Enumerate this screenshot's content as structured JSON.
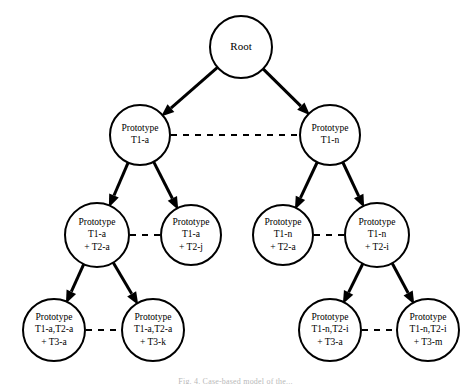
{
  "figure": {
    "caption": "Fig. 4. Case-based model of the...",
    "background_color": "#ffffff",
    "line_color": "#000000"
  },
  "nodes": [
    {
      "id": "root",
      "level": 0,
      "cx": 241,
      "cy": 47,
      "r": 31,
      "lines": [
        "Root"
      ]
    },
    {
      "id": "p-t1a",
      "level": 1,
      "cx": 140,
      "cy": 135,
      "r": 30,
      "lines": [
        "Prototype",
        "T1-a"
      ]
    },
    {
      "id": "p-t1n",
      "level": 1,
      "cx": 330,
      "cy": 135,
      "r": 30,
      "lines": [
        "Prototype",
        "T1-n"
      ]
    },
    {
      "id": "p-t1a-t2a",
      "level": 2,
      "cx": 97,
      "cy": 235,
      "r": 32,
      "lines": [
        "Prototype",
        "T1-a",
        "+ T2-a"
      ]
    },
    {
      "id": "p-t1a-t2j",
      "level": 2,
      "cx": 191,
      "cy": 235,
      "r": 30,
      "lines": [
        "Prototype",
        "T1-a",
        "+ T2-j"
      ]
    },
    {
      "id": "p-t1n-t2a",
      "level": 2,
      "cx": 283,
      "cy": 235,
      "r": 30,
      "lines": [
        "Prototype",
        "T1-n",
        "+ T2-a"
      ]
    },
    {
      "id": "p-t1n-t2i",
      "level": 2,
      "cx": 377,
      "cy": 235,
      "r": 32,
      "lines": [
        "Prototype",
        "T1-n",
        "+ T2-i"
      ]
    },
    {
      "id": "p-t1a-t2a-t3a",
      "level": 3,
      "cx": 54,
      "cy": 330,
      "r": 31,
      "lines": [
        "Prototype",
        "T1-a,T2-a",
        "+ T3-a"
      ]
    },
    {
      "id": "p-t1a-t2a-t3k",
      "level": 3,
      "cx": 153,
      "cy": 330,
      "r": 31,
      "lines": [
        "Prototype",
        "T1-a,T2-a",
        "+ T3-k"
      ]
    },
    {
      "id": "p-t1n-t2i-t3a",
      "level": 3,
      "cx": 330,
      "cy": 330,
      "r": 31,
      "lines": [
        "Prototype",
        "T1-n,T2-i",
        "+ T3-a"
      ]
    },
    {
      "id": "p-t1n-t2i-t3m",
      "level": 3,
      "cx": 428,
      "cy": 330,
      "r": 31,
      "lines": [
        "Prototype",
        "T1-n,T2-i",
        "+ T3-m"
      ]
    }
  ],
  "edges_solid": [
    {
      "id": "root-to-t1a",
      "from": "root",
      "to": "p-t1a"
    },
    {
      "id": "root-to-t1n",
      "from": "root",
      "to": "p-t1n"
    },
    {
      "id": "t1a-to-t1a-t2a",
      "from": "p-t1a",
      "to": "p-t1a-t2a"
    },
    {
      "id": "t1a-to-t1a-t2j",
      "from": "p-t1a",
      "to": "p-t1a-t2j"
    },
    {
      "id": "t1n-to-t1n-t2a",
      "from": "p-t1n",
      "to": "p-t1n-t2a"
    },
    {
      "id": "t1n-to-t1n-t2i",
      "from": "p-t1n",
      "to": "p-t1n-t2i"
    },
    {
      "id": "t1a-t2a-to-t3a",
      "from": "p-t1a-t2a",
      "to": "p-t1a-t2a-t3a"
    },
    {
      "id": "t1a-t2a-to-t3k",
      "from": "p-t1a-t2a",
      "to": "p-t1a-t2a-t3k"
    },
    {
      "id": "t1n-t2i-to-t3a",
      "from": "p-t1n-t2i",
      "to": "p-t1n-t2i-t3a"
    },
    {
      "id": "t1n-t2i-to-t3m",
      "from": "p-t1n-t2i",
      "to": "p-t1n-t2i-t3m"
    }
  ],
  "edges_dashed": [
    {
      "id": "link-t1a-t1n",
      "from": "p-t1a",
      "to": "p-t1n"
    },
    {
      "id": "link-t2a-t2j",
      "from": "p-t1a-t2a",
      "to": "p-t1a-t2j"
    },
    {
      "id": "link-t2a-t2i",
      "from": "p-t1n-t2a",
      "to": "p-t1n-t2i"
    },
    {
      "id": "link-t3a-t3k",
      "from": "p-t1a-t2a-t3a",
      "to": "p-t1a-t2a-t3k"
    },
    {
      "id": "link-t3a-t3m",
      "from": "p-t1n-t2i-t3a",
      "to": "p-t1n-t2i-t3m"
    }
  ]
}
